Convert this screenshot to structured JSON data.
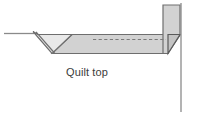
{
  "figure": {
    "width": 198,
    "height": 116,
    "background": "#ffffff",
    "caption": "Quilt top",
    "caption_color": "#3b3b3b"
  },
  "colors": {
    "fabric_fill_light": "#d8d8d8",
    "fabric_fill_mid": "#cfcfcf",
    "fabric_fill_dark": "#c4c4c4",
    "flap_fill": "#e6e6e6",
    "outline": "#6e6e6e",
    "outline_dark": "#5a5a5a",
    "thin_line": "#8a8a8a",
    "dashed_stitch": "#7a7a7a"
  },
  "parts": [
    {
      "id": "guide-line-left",
      "label": "fold guide line",
      "type": "line"
    },
    {
      "id": "binding-flap",
      "label": "folded binding flap",
      "type": "polygon"
    },
    {
      "id": "quilt-body",
      "label": "quilt top body",
      "type": "polygon"
    },
    {
      "id": "stitch-line",
      "label": "dashed stitch line",
      "type": "dashed-line"
    },
    {
      "id": "turned-edge",
      "label": "turned up edge",
      "type": "polygon"
    },
    {
      "id": "edge-bevel",
      "label": "edge bevel",
      "type": "polygon"
    },
    {
      "id": "vertical-rule",
      "label": "vertical reference line",
      "type": "line"
    }
  ]
}
